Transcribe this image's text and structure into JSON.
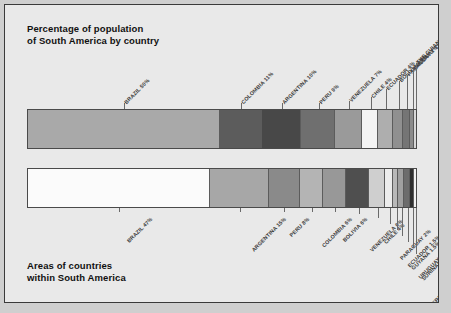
{
  "figure": {
    "background_color": "#e9e9e9",
    "border_color": "#3a3a3a"
  },
  "charts": {
    "population": {
      "title": "Percentage of population\nof South America by country"
    },
    "area": {
      "title": "Areas of countries\nwithin South America"
    }
  },
  "chart_data": [
    {
      "type": "bar",
      "orientation": "horizontal-stacked",
      "title": "Percentage of population of South America by country",
      "xlabel": "",
      "ylabel": "",
      "unit": "percent",
      "total": 100,
      "categories": [
        "BRAZIL",
        "COLOMBIA",
        "ARGENTINA",
        "PERU",
        "VENEZUELA",
        "CHILE",
        "ECUADOR",
        "BOLIVIA",
        "PARAGUAY",
        "URUGUAY",
        "THE GUIANAS"
      ],
      "values": [
        50,
        11,
        10,
        9,
        7,
        4,
        4,
        2.5,
        2,
        1,
        0.5
      ],
      "labels": [
        "BRAZIL 50%",
        "COLOMBIA 11%",
        "ARGENTINA 10%",
        "PERU 9%",
        "VENEZUELA 7%",
        "CHILE 4%",
        "ECUADOR 4%",
        "BOLIVIA 2.5%",
        "PARAGUAY 2%",
        "URUGUAY 1%",
        "THE GUIANAS 0.5%"
      ],
      "colors": [
        "#a9a9a9",
        "#5c5c5c",
        "#484848",
        "#6f6f6f",
        "#9a9a9a",
        "#f4f4f4",
        "#aeaeae",
        "#909090",
        "#757575",
        "#8c8c8c",
        "#d8d8d8"
      ],
      "legend": "none",
      "grid": false
    },
    {
      "type": "bar",
      "orientation": "horizontal-stacked",
      "title": "Areas of countries within South America",
      "xlabel": "",
      "ylabel": "",
      "unit": "percent",
      "total": 100,
      "categories": [
        "BRAZIL",
        "ARGENTINA",
        "PERU",
        "COLOMBIA",
        "BOLIVIA",
        "VENEZUELA",
        "CHILE",
        "PARAGUAY",
        "ECUADOR",
        "GUYANA",
        "URUGUAY",
        "SURINAM",
        "FRENCH GUIANA"
      ],
      "values": [
        47,
        15,
        8,
        6,
        6,
        6,
        4,
        2,
        1.5,
        1.5,
        1.5,
        1,
        0.5
      ],
      "labels": [
        "BRAZIL 47%",
        "ARGENTINA 15%",
        "PERU 8%",
        "COLOMBIA 6%",
        "BOLIVIA 6%",
        "VENEZUELA 6%",
        "CHILE 4%",
        "PARAGUAY 2%",
        "ECUADOR 1.5%",
        "GUYANA 1.5%",
        "URUGUAY 1.5%",
        "SURINAM 1%",
        "FRENCH GUIANA 0.5%"
      ],
      "colors": [
        "#fbfbfb",
        "#a7a7a7",
        "#8a8a8a",
        "#b4b4b4",
        "#989898",
        "#4f4f4f",
        "#cfcfcf",
        "#ededed",
        "#b9b9b9",
        "#a0a0a0",
        "#6c6c6c",
        "#2f2f2f",
        "#f2f2f2"
      ],
      "legend": "none",
      "grid": false
    }
  ]
}
